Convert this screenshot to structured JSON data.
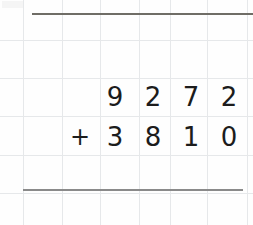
{
  "worksheet": {
    "type": "vertical-addition-problem",
    "paper": {
      "background_color": "#fefefe",
      "grid_line_color": "#e6e8ea",
      "vertical_line_positions": [
        23,
        62,
        100,
        140,
        170,
        207,
        248
      ],
      "horizontal_line_positions": [
        40,
        78,
        116,
        155,
        190
      ]
    },
    "rules": {
      "top_rule_color": "#6f6d66",
      "bottom_rule_color": "#8a8a8a"
    },
    "digit_color": "#1c1c1c",
    "operator": "+",
    "rows": [
      {
        "name": "addend-1",
        "operator": "",
        "digits": [
          "9",
          "2",
          "7",
          "2"
        ],
        "value": "9272"
      },
      {
        "name": "addend-2",
        "operator": "+",
        "digits": [
          "3",
          "8",
          "1",
          "0"
        ],
        "value": "3810"
      },
      {
        "name": "sum",
        "operator": "",
        "digits": [
          "",
          "",
          "",
          ""
        ],
        "value": ""
      }
    ]
  }
}
